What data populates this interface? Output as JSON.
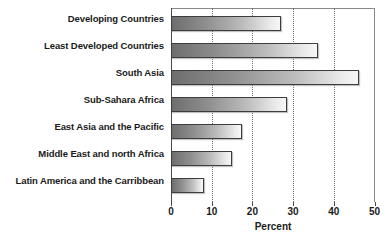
{
  "chart_data": {
    "type": "bar",
    "orientation": "horizontal",
    "title": "",
    "xlabel": "Percent",
    "ylabel": "",
    "categories": [
      "Developing Countries",
      "Least Developed Countries",
      "South Asia",
      "Sub-Sahara Africa",
      "East Asia and the Pacific",
      "Middle East and north Africa",
      "Latin America and the Carribbean"
    ],
    "values": [
      27,
      36,
      46,
      28.5,
      17.5,
      15,
      8
    ],
    "xlim": [
      0,
      50
    ],
    "xticks": [
      0,
      10,
      20,
      30,
      40,
      50
    ],
    "xtick_labels": [
      "0",
      "10",
      "20",
      "30",
      "40",
      "50"
    ],
    "grid": "vertical-dotted",
    "legend": "none",
    "bar_fill": "#8f8f8f",
    "bar_border": "#3d3d3d",
    "text_color": "#1a1a1a"
  }
}
